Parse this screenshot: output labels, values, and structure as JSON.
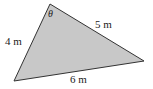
{
  "diagram": {
    "type": "triangle",
    "fill_color": "#c8c8c8",
    "stroke_color": "#333333",
    "vertices": {
      "top": [
        50,
        4
      ],
      "bottom_left": [
        14,
        81
      ],
      "right": [
        144,
        61
      ]
    },
    "angle_label": "θ",
    "sides": {
      "left": "4 m",
      "top_right": "5 m",
      "bottom": "6 m"
    }
  }
}
